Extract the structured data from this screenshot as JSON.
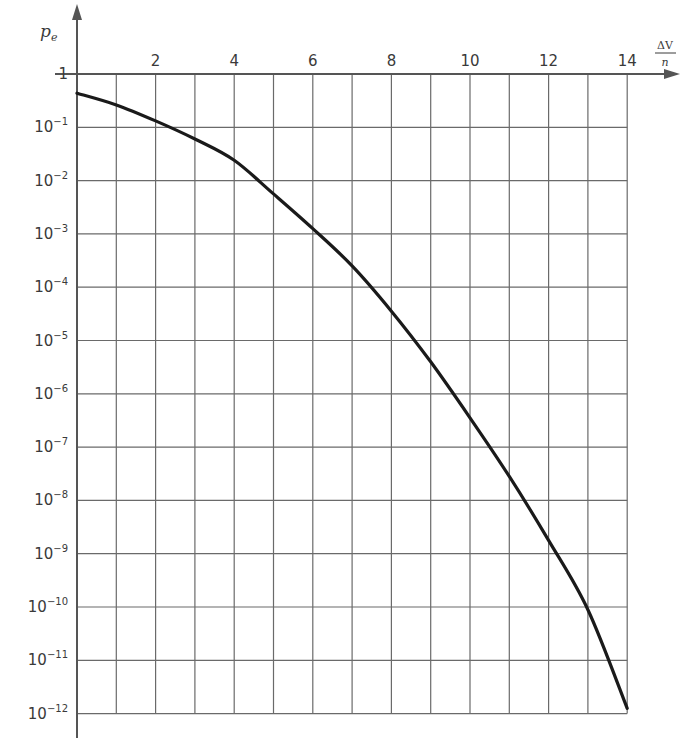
{
  "chart_data": {
    "type": "line",
    "title": "",
    "xlabel": "ΔV/n",
    "xlabel_numerator": "ΔV",
    "xlabel_denominator": "n",
    "ylabel": "p_e",
    "ylabel_main": "p",
    "ylabel_sub": "e",
    "yscale": "log",
    "xlim": [
      0,
      14
    ],
    "ylim": [
      1e-12,
      1
    ],
    "grid": true,
    "x_ticks": [
      2,
      4,
      6,
      8,
      10,
      12,
      14
    ],
    "x_tick_labels": [
      "2",
      "4",
      "6",
      "8",
      "10",
      "12",
      "14"
    ],
    "y_ticks": [
      {
        "exp": 0,
        "label": "1"
      },
      {
        "exp": -1,
        "label": "10",
        "sup": "−1"
      },
      {
        "exp": -2,
        "label": "10",
        "sup": "−2"
      },
      {
        "exp": -3,
        "label": "10",
        "sup": "−3"
      },
      {
        "exp": -4,
        "label": "10",
        "sup": "−4"
      },
      {
        "exp": -5,
        "label": "10",
        "sup": "−5"
      },
      {
        "exp": -6,
        "label": "10",
        "sup": "−6"
      },
      {
        "exp": -7,
        "label": "10",
        "sup": "−7"
      },
      {
        "exp": -8,
        "label": "10",
        "sup": "−8"
      },
      {
        "exp": -9,
        "label": "10",
        "sup": "−9"
      },
      {
        "exp": -10,
        "label": "10",
        "sup": "−10"
      },
      {
        "exp": -11,
        "label": "10",
        "sup": "−11"
      },
      {
        "exp": -12,
        "label": "10",
        "sup": "−12"
      }
    ],
    "series": [
      {
        "name": "p_e",
        "x": [
          0,
          1,
          2,
          3,
          4,
          5,
          6,
          7,
          8,
          9,
          10,
          11,
          12,
          13,
          14
        ],
        "log10_y": [
          -0.36,
          -0.58,
          -0.88,
          -1.22,
          -1.62,
          -2.25,
          -2.9,
          -3.6,
          -4.45,
          -5.4,
          -6.45,
          -7.55,
          -8.75,
          -10.05,
          -11.9
        ],
        "y": [
          0.44,
          0.26,
          0.13,
          0.06,
          0.024,
          0.0056,
          0.0013,
          0.00025,
          3.5e-05,
          4e-06,
          3.5e-07,
          2.8e-08,
          1.8e-09,
          8.9e-11,
          1.3e-12
        ]
      }
    ],
    "colors": {
      "curve": "#1a1a1a",
      "grid": "#6a6a6a",
      "axis": "#555555"
    }
  }
}
